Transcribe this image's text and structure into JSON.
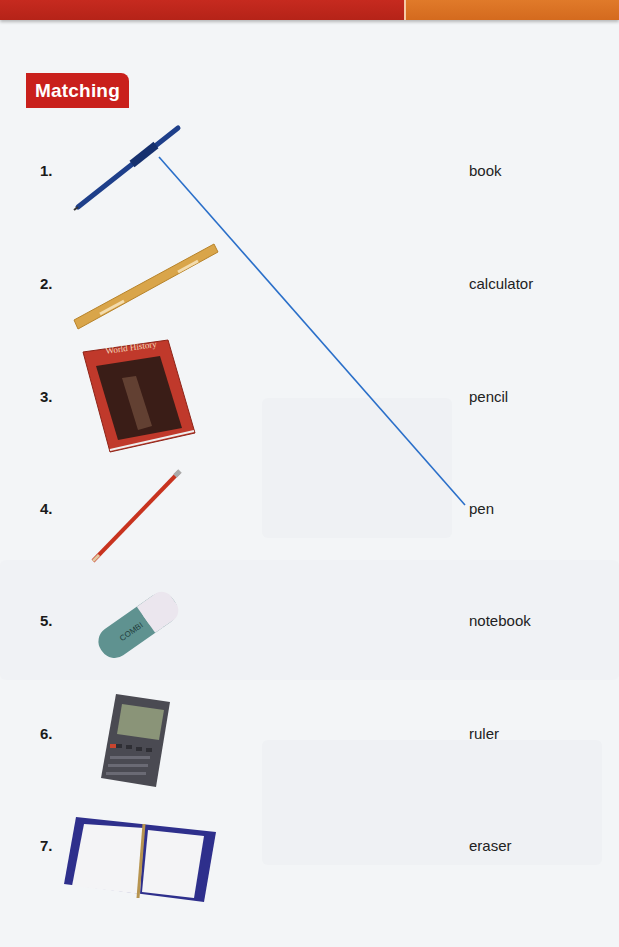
{
  "header": {
    "bar_colors": {
      "left": "#c62a1f",
      "right": "#e07a2a"
    }
  },
  "section": {
    "title": "Matching",
    "title_color": "#c9201c"
  },
  "left_items": [
    {
      "number": "1.",
      "picture": "pen",
      "y": 170
    },
    {
      "number": "2.",
      "picture": "ruler",
      "y": 283
    },
    {
      "number": "3.",
      "picture": "book",
      "picture_text": "World History",
      "y": 396
    },
    {
      "number": "4.",
      "picture": "pencil",
      "y": 508
    },
    {
      "number": "5.",
      "picture": "eraser",
      "picture_text": "COMBI",
      "y": 620
    },
    {
      "number": "6.",
      "picture": "calculator",
      "y": 733
    },
    {
      "number": "7.",
      "picture": "notebook",
      "y": 845
    }
  ],
  "right_words": [
    {
      "label": "book",
      "y": 170
    },
    {
      "label": "calculator",
      "y": 283
    },
    {
      "label": "pencil",
      "y": 396
    },
    {
      "label": "pen",
      "y": 508
    },
    {
      "label": "notebook",
      "y": 620
    },
    {
      "label": "ruler",
      "y": 733
    },
    {
      "label": "eraser",
      "y": 845
    }
  ],
  "matches_drawn": [
    {
      "from": "1.",
      "to": "pen",
      "color": "#2a6fc9"
    }
  ]
}
